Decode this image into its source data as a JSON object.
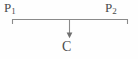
{
  "diagram": {
    "background_color": "#fefefe",
    "stroke_color": "#8a8a8a",
    "text_color": "#4a4a4a",
    "nodes": {
      "left_endpoint": {
        "base": "P",
        "subscript": "1",
        "full_label": "P1"
      },
      "right_endpoint": {
        "base": "P",
        "subscript": "2",
        "full_label": "P2"
      },
      "target": {
        "full_label": "C"
      }
    },
    "connector": {
      "type": "bracket-with-arrow",
      "bracket": {
        "left_x": 12,
        "right_x": 128,
        "bar_y": 19,
        "tick_drop": 4
      },
      "arrow": {
        "x": 69,
        "from_y": 19,
        "to_y": 38,
        "head": "filled-triangle-down"
      }
    }
  }
}
